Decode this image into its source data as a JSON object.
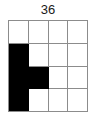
{
  "figure": {
    "label": "36",
    "grid": {
      "rows": 4,
      "cols": 4,
      "fill_color": "#000000",
      "empty_color": "#ffffff",
      "line_color": "#8c8c8c",
      "cells": [
        [
          0,
          0,
          0,
          0
        ],
        [
          1,
          0,
          0,
          0
        ],
        [
          1,
          1,
          0,
          0
        ],
        [
          1,
          0,
          0,
          0
        ]
      ]
    }
  }
}
